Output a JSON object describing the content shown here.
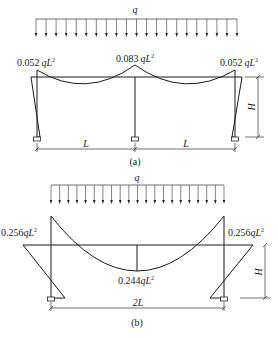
{
  "figure_a": {
    "load_label": "q",
    "moment_left": "0.052",
    "moment_center": "0.083",
    "moment_right": "0.052",
    "moment_unit": "qL",
    "moment_exp": "2",
    "span_left": "L",
    "span_right": "L",
    "height_label": "H",
    "caption": "(a)"
  },
  "figure_b": {
    "load_label": "q",
    "moment_left": "0.256",
    "moment_right": "0.256",
    "moment_mid": "0.244",
    "moment_unit": "qL",
    "moment_exp": "2",
    "span": "2L",
    "height_label": "H",
    "caption": "(b)"
  }
}
